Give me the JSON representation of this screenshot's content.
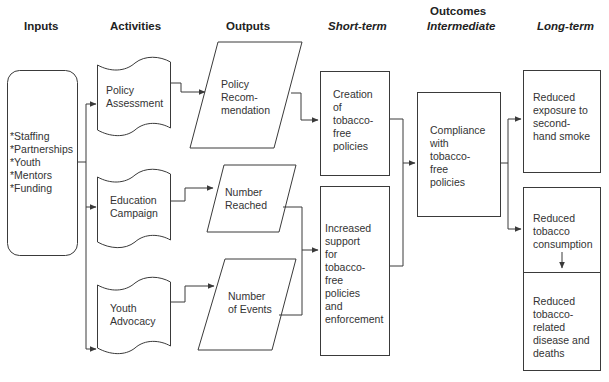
{
  "headers": {
    "inputs": "Inputs",
    "activities": "Activities",
    "outputs": "Outputs",
    "outcomes": "Outcomes",
    "short_term": "Short-term",
    "intermediate": "Intermediate",
    "long_term": "Long-term"
  },
  "inputs": {
    "items": "*Staffing\n*Partnerships\n*Youth\n*Mentors\n*Funding"
  },
  "activities": [
    {
      "label": "Policy\nAssessment"
    },
    {
      "label": "Education\nCampaign"
    },
    {
      "label": "Youth\nAdvocacy"
    }
  ],
  "outputs": [
    {
      "label": "Policy\nRecom-\nmendation"
    },
    {
      "label": "Number\nReached"
    },
    {
      "label": "Number\nof Events"
    }
  ],
  "short_term": [
    {
      "label": "Creation\nof\ntobacco-\nfree\npolicies"
    },
    {
      "label": "Increased\nsupport\nfor\ntobacco-\nfree\npolicies\nand\nenforcement"
    }
  ],
  "intermediate": [
    {
      "label": "Compliance\nwith\ntobacco-\nfree\npolicies"
    }
  ],
  "long_term": [
    {
      "label": "Reduced\nexposure to\nsecond-\nhand smoke"
    },
    {
      "label": "Reduced\ntobacco\nconsumption"
    },
    {
      "label": "Reduced\ntobacco-\nrelated\ndisease and\ndeaths"
    }
  ],
  "colors": {
    "stroke": "#3a3a3a",
    "text": "#333333",
    "background": "#ffffff"
  }
}
